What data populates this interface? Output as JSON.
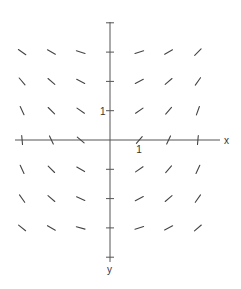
{
  "figure": {
    "type": "slope-field",
    "x_axis_label": "x",
    "y_axis_label": "y",
    "x_unit_label": "1",
    "y_unit_label": "1",
    "colors": {
      "axis": "#555555",
      "segment": "#444444",
      "text": "#333333"
    }
  },
  "layout": {
    "origin": [
      110,
      140
    ],
    "spacing": 29.3,
    "x_axis_range_px": [
      15,
      220
    ],
    "y_axis_range_px": [
      22,
      262
    ],
    "x_ticks": [
      -3,
      -2,
      -1,
      1,
      2,
      3
    ],
    "y_ticks": [
      4,
      3,
      2,
      1,
      -1,
      -2,
      -3,
      -4
    ],
    "segment_length": 9
  },
  "slope_field": {
    "x_values": [
      -3,
      -2,
      -1,
      1,
      2,
      3
    ],
    "rows": [
      {
        "y": 3,
        "angles_deg": [
          35,
          30,
          18,
          -18,
          -30,
          -45
        ]
      },
      {
        "y": 2,
        "angles_deg": [
          50,
          40,
          28,
          -28,
          -40,
          -55
        ]
      },
      {
        "y": 1,
        "angles_deg": [
          65,
          45,
          35,
          -35,
          -50,
          -70
        ]
      },
      {
        "y": 0,
        "angles_deg": [
          85,
          65,
          40,
          -50,
          -65,
          -85
        ]
      },
      {
        "y": -1,
        "angles_deg": [
          65,
          45,
          30,
          -35,
          -50,
          -65
        ]
      },
      {
        "y": -2,
        "angles_deg": [
          55,
          40,
          25,
          -28,
          -40,
          -55
        ]
      },
      {
        "y": -3,
        "angles_deg": [
          38,
          30,
          15,
          -18,
          -28,
          -40
        ]
      }
    ]
  }
}
